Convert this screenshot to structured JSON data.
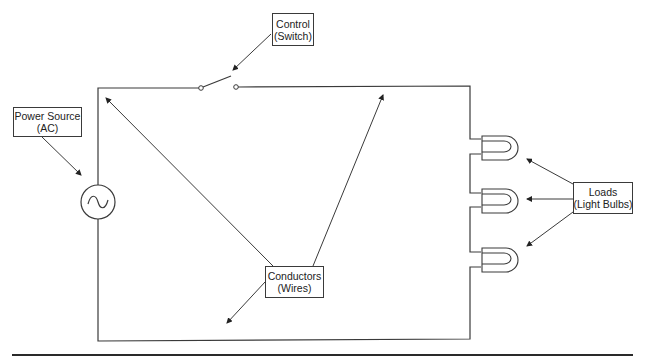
{
  "diagram": {
    "type": "simple electric circuit",
    "labels": {
      "control": {
        "line1": "Control",
        "line2": "(Switch)"
      },
      "power_source": {
        "line1": "Power Source",
        "line2": "(AC)"
      },
      "conductors": {
        "line1": "Conductors",
        "line2": "(Wires)"
      },
      "loads": {
        "line1": "Loads",
        "line2": "(Light Bulbs)"
      }
    },
    "components": [
      {
        "id": "switch",
        "symbol": "open-switch-icon"
      },
      {
        "id": "ac-source",
        "symbol": "ac-source-icon",
        "glyph": "∿"
      },
      {
        "id": "bulb-1",
        "symbol": "light-bulb-icon"
      },
      {
        "id": "bulb-2",
        "symbol": "light-bulb-icon"
      },
      {
        "id": "bulb-3",
        "symbol": "light-bulb-icon"
      }
    ],
    "colors": {
      "line": "#3a3a3a",
      "background": "#ffffff",
      "text": "#222222"
    }
  }
}
